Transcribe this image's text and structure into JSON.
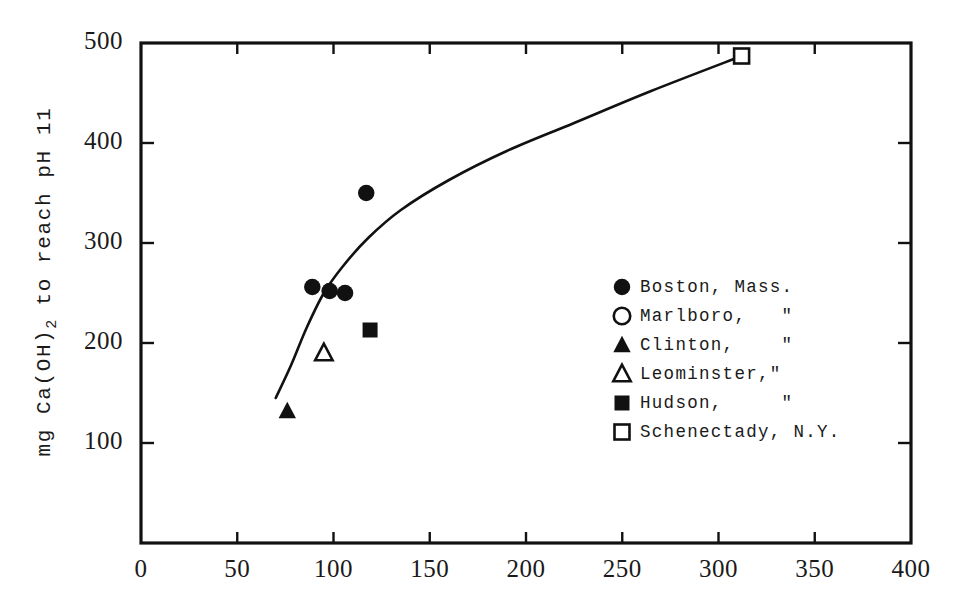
{
  "chart_data": {
    "type": "scatter",
    "title": "",
    "xlabel": "",
    "ylabel": "mg Ca(OH)2 to reach pH 11",
    "ylabel_base": "mg Ca(OH)",
    "ylabel_sub": "2",
    "ylabel_tail": " to reach pH 11",
    "xlim": [
      0,
      400
    ],
    "ylim": [
      0,
      500
    ],
    "xticks": [
      0,
      50,
      100,
      150,
      200,
      250,
      300,
      350,
      400
    ],
    "yticks": [
      100,
      200,
      300,
      400,
      500
    ],
    "xtick_labels": [
      "0",
      "50",
      "100",
      "150",
      "200",
      "250",
      "300",
      "350",
      "400"
    ],
    "ytick_labels": [
      "100",
      "200",
      "300",
      "400",
      "500"
    ],
    "grid": false,
    "legend_position": "center-right",
    "frame": "box",
    "series": [
      {
        "name": "Boston, Mass.",
        "legend_label": "Boston, Mass.",
        "marker": "filled-circle",
        "color": "#111111",
        "points": [
          {
            "x": 89,
            "y": 256
          },
          {
            "x": 98,
            "y": 252
          },
          {
            "x": 106,
            "y": 250
          },
          {
            "x": 117,
            "y": 350
          }
        ]
      },
      {
        "name": "Marlboro",
        "legend_label": "Marlboro,   \"",
        "marker": "open-circle",
        "color": "#111111",
        "points": []
      },
      {
        "name": "Clinton",
        "legend_label": "Clinton,    \"",
        "marker": "filled-triangle",
        "color": "#111111",
        "points": [
          {
            "x": 76,
            "y": 132
          }
        ]
      },
      {
        "name": "Leominster",
        "legend_label": "Leominster,\"",
        "marker": "open-triangle",
        "color": "#111111",
        "points": [
          {
            "x": 95,
            "y": 190
          }
        ]
      },
      {
        "name": "Hudson",
        "legend_label": "Hudson,     \"",
        "marker": "filled-square",
        "color": "#111111",
        "points": [
          {
            "x": 119,
            "y": 213
          }
        ]
      },
      {
        "name": "Schenectady, N.Y.",
        "legend_label": "Schenectady, N.Y.",
        "marker": "open-square",
        "color": "#111111",
        "points": [
          {
            "x": 312,
            "y": 487
          }
        ]
      }
    ],
    "fit_curve": {
      "name": "fitted-trend-curve",
      "description": "smooth increasing curve through the data",
      "points": [
        {
          "x": 70,
          "y": 145
        },
        {
          "x": 78,
          "y": 178
        },
        {
          "x": 86,
          "y": 215
        },
        {
          "x": 95,
          "y": 250
        },
        {
          "x": 105,
          "y": 277
        },
        {
          "x": 118,
          "y": 305
        },
        {
          "x": 135,
          "y": 333
        },
        {
          "x": 160,
          "y": 363
        },
        {
          "x": 190,
          "y": 392
        },
        {
          "x": 225,
          "y": 420
        },
        {
          "x": 265,
          "y": 452
        },
        {
          "x": 312,
          "y": 487
        }
      ]
    }
  }
}
